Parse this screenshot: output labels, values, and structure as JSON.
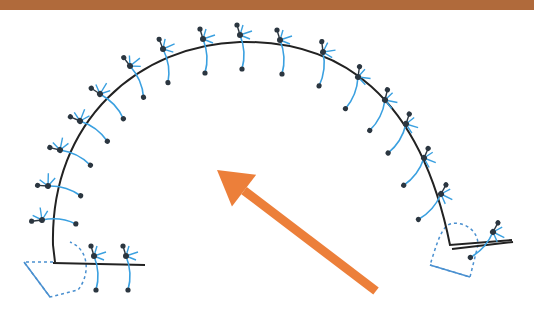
{
  "colors": {
    "header": "#b06a3b",
    "track": "#222222",
    "molecule_body": "#3aa0e0",
    "molecule_atom": "#2b3640",
    "dashed": "#4a90d0",
    "arrow": "#ec7f3a",
    "background": "#ffffff"
  },
  "diagram": {
    "track_path": "M55,262 L53,245 C50,120 140,45 240,42 C340,40 420,95 450,245 L512,240",
    "left_end": {
      "x": 53,
      "y": 262,
      "baseline_to": 145
    },
    "right_end": {
      "x": 452,
      "y": 248,
      "baseline_to": 512
    },
    "arrow": {
      "from": [
        376,
        291
      ],
      "to": [
        217,
        170
      ]
    },
    "molecules": [
      {
        "x": 42,
        "y": 220,
        "angle": -80
      },
      {
        "x": 48,
        "y": 186,
        "angle": -70
      },
      {
        "x": 60,
        "y": 150,
        "angle": -60
      },
      {
        "x": 80,
        "y": 121,
        "angle": -50
      },
      {
        "x": 100,
        "y": 94,
        "angle": -40
      },
      {
        "x": 130,
        "y": 66,
        "angle": -20
      },
      {
        "x": 163,
        "y": 49,
        "angle": -5
      },
      {
        "x": 203,
        "y": 39,
        "angle": 0
      },
      {
        "x": 240,
        "y": 35,
        "angle": 0
      },
      {
        "x": 280,
        "y": 40,
        "angle": 0
      },
      {
        "x": 323,
        "y": 52,
        "angle": 10
      },
      {
        "x": 358,
        "y": 77,
        "angle": 25
      },
      {
        "x": 385,
        "y": 100,
        "angle": 30
      },
      {
        "x": 406,
        "y": 124,
        "angle": 35
      },
      {
        "x": 424,
        "y": 158,
        "angle": 40
      },
      {
        "x": 441,
        "y": 194,
        "angle": 45
      },
      {
        "x": 493,
        "y": 232,
        "angle": 45
      },
      {
        "x": 94,
        "y": 256,
        "angle": 0
      },
      {
        "x": 126,
        "y": 256,
        "angle": 0
      }
    ]
  }
}
